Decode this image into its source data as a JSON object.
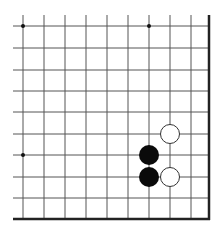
{
  "diagram": {
    "type": "go-board-fragment",
    "colors": {
      "background": "#ffffff",
      "grid_line": "#555555",
      "edge_line": "#222222",
      "black_stone": "#0a0a0a",
      "white_stone_fill": "#ffffff",
      "white_stone_stroke": "#333333",
      "star_point": "#111111"
    },
    "grid": {
      "columns_x": [
        23,
        44,
        65,
        86,
        107,
        128,
        149,
        170,
        191
      ],
      "rows_y": [
        26,
        48,
        70,
        91,
        112,
        134,
        155,
        177,
        198
      ],
      "right_edge_x": 209,
      "bottom_edge_y": 219,
      "open_left_x": 13,
      "open_top_y": 15
    },
    "star_points": [
      {
        "col": 0,
        "row": 0
      },
      {
        "col": 6,
        "row": 0
      },
      {
        "col": 0,
        "row": 6
      }
    ],
    "stones": [
      {
        "color": "black",
        "col": 6,
        "row": 6
      },
      {
        "color": "black",
        "col": 6,
        "row": 7
      },
      {
        "color": "white",
        "col": 7,
        "row": 5
      },
      {
        "color": "white",
        "col": 7,
        "row": 7
      }
    ],
    "stone_radius": 10
  }
}
